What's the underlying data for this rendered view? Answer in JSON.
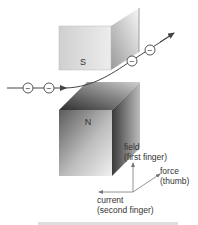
{
  "diagram": {
    "magnets": {
      "top": {
        "pole_label": "S"
      },
      "bottom": {
        "pole_label": "N"
      }
    },
    "electron": {
      "symbol": "−",
      "count": 4
    },
    "axes": {
      "field": {
        "line1": "field",
        "line2": "(first finger)"
      },
      "force": {
        "line1": "force",
        "line2": "(thumb)"
      },
      "current": {
        "line1": "current",
        "line2": "(second finger)"
      }
    },
    "caption_partial": "... The left-hand rule ..."
  },
  "colors": {
    "line": "#444444",
    "text": "#333333",
    "magnet_light": "#f2f2f2",
    "magnet_dark": "#5a5a5a"
  }
}
